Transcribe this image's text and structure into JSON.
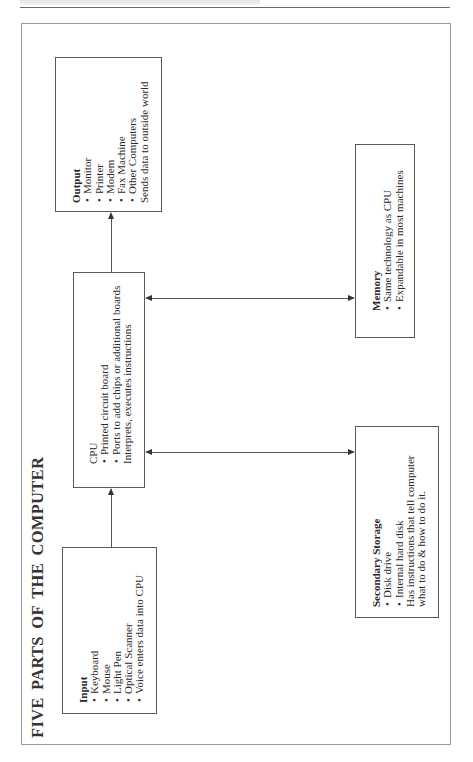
{
  "diagram": {
    "title": "FIVE PARTS OF THE COMPUTER",
    "orientation": "rotated -90deg (landscape page)",
    "boxes": {
      "input": {
        "title": "Input",
        "items": [
          {
            "text": "Keyboard",
            "bullet": true
          },
          {
            "text": "Mouse",
            "bullet": true
          },
          {
            "text": "Light Pen",
            "bullet": true
          },
          {
            "text": "Optical Scanner",
            "bullet": true
          },
          {
            "text": "Voice enters data into CPU",
            "bullet": true
          }
        ]
      },
      "cpu": {
        "title": "CPU",
        "items": [
          {
            "text": "Printed circuit board",
            "bullet": true
          },
          {
            "text": "Ports to add chips or additional boards",
            "bullet": true
          },
          {
            "text": "Interprets, executes instructions",
            "bullet": false
          }
        ]
      },
      "output": {
        "title": "Output",
        "items": [
          {
            "text": "Monitor",
            "bullet": true
          },
          {
            "text": "Printer",
            "bullet": true
          },
          {
            "text": "Modem",
            "bullet": true
          },
          {
            "text": "Fax Machine",
            "bullet": true
          },
          {
            "text": "Other Computers",
            "bullet": true
          },
          {
            "text": "Sends data to outside world",
            "bullet": false
          }
        ]
      },
      "memory": {
        "title": "Memory",
        "items": [
          {
            "text": "Same technology as CPU",
            "bullet": true
          },
          {
            "text": "Expandable in most machines",
            "bullet": true
          }
        ]
      },
      "secondary_storage": {
        "title": "Secondary Storage",
        "items": [
          {
            "text": "Disk drive",
            "bullet": true
          },
          {
            "text": "Internal hard disk",
            "bullet": true
          },
          {
            "text": "Has instructions that tell computer",
            "bullet": false
          },
          {
            "text": "what to do & how to do it.",
            "bullet": false
          }
        ]
      }
    },
    "connections": [
      {
        "from": "Input",
        "to": "CPU",
        "type": "one-way"
      },
      {
        "from": "CPU",
        "to": "Output",
        "type": "one-way"
      },
      {
        "from": "CPU",
        "to": "Memory",
        "type": "two-way"
      },
      {
        "from": "CPU",
        "to": "Secondary Storage",
        "type": "two-way"
      }
    ]
  }
}
